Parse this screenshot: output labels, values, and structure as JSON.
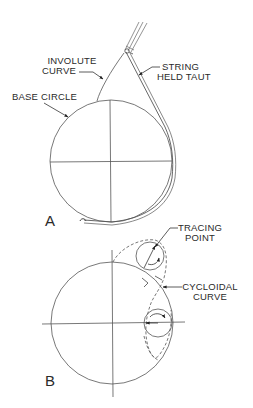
{
  "figure_a": {
    "letter": "A",
    "labels": {
      "involute_line1": "INVOLUTE",
      "involute_line2": "CURVE",
      "string_line1": "STRING",
      "string_line2": "HELD TAUT",
      "base_circle": "BASE CIRCLE"
    }
  },
  "figure_b": {
    "letter": "B",
    "labels": {
      "tracing_line1": "TRACING",
      "tracing_line2": "POINT",
      "cycloidal_line1": "CYCLOIDAL",
      "cycloidal_line2": "CURVE"
    }
  },
  "colors": {
    "line": "#555555",
    "text": "#2a2a2a",
    "background": "#ffffff"
  }
}
